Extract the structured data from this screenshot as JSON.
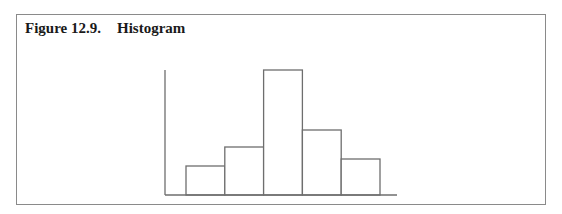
{
  "figure": {
    "label": "Figure 12.9.",
    "title": "Histogram"
  },
  "chart_data": {
    "type": "bar",
    "title": "Histogram",
    "xlabel": "",
    "ylabel": "",
    "categories": [
      "1",
      "2",
      "3",
      "4",
      "5"
    ],
    "values": [
      29,
      48,
      125,
      65,
      36
    ],
    "value_units": "relative bar height (no axis scale shown)",
    "grid": false,
    "legend": null,
    "bar_color": "#ffffff",
    "edge_color": "#6e6e6e"
  }
}
